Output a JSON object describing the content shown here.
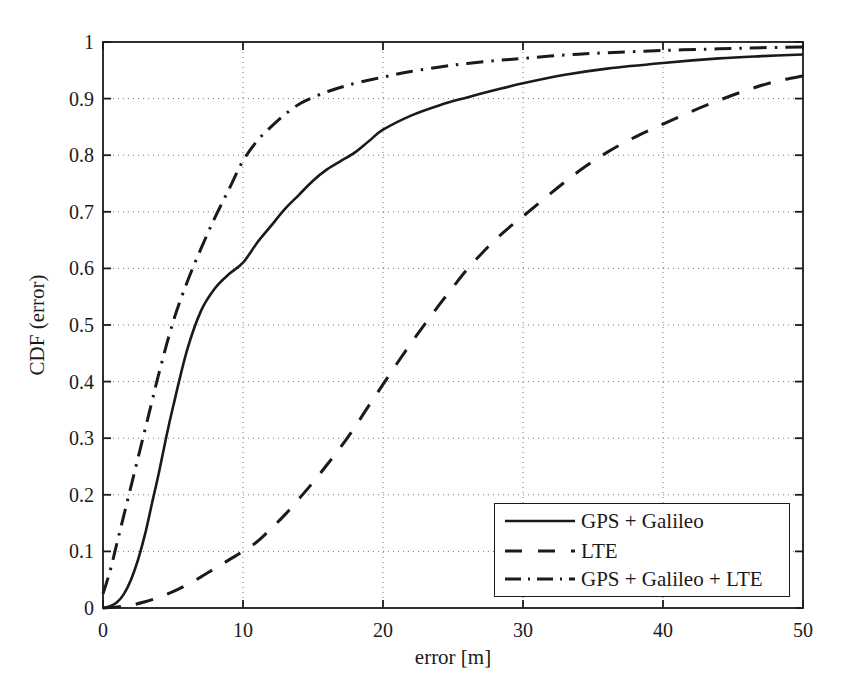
{
  "chart_data": {
    "type": "line",
    "title": "",
    "xlabel": "error [m]",
    "ylabel": "CDF (error)",
    "xlim": [
      0,
      50
    ],
    "ylim": [
      0,
      1
    ],
    "grid": true,
    "legend_position": "lower right",
    "xticks": [
      "0",
      "10",
      "20",
      "30",
      "40",
      "50"
    ],
    "xtick_values": [
      0,
      10,
      20,
      30,
      40,
      50
    ],
    "yticks": [
      "0",
      "0.1",
      "0.2",
      "0.3",
      "0.4",
      "0.5",
      "0.6",
      "0.7",
      "0.8",
      "0.9",
      "1"
    ],
    "ytick_values": [
      0,
      0.1,
      0.2,
      0.3,
      0.4,
      0.5,
      0.6,
      0.7,
      0.8,
      0.9,
      1
    ],
    "series": [
      {
        "name": "GPS + Galileo",
        "style": "solid",
        "color": "#1a1a1a",
        "x": [
          0,
          0.5,
          1,
          1.5,
          2,
          2.5,
          3,
          3.5,
          4,
          4.5,
          5,
          6,
          7,
          8,
          9,
          10,
          11,
          12,
          13,
          14,
          15,
          16,
          17,
          18,
          19,
          20,
          22,
          24,
          26,
          28,
          30,
          33,
          36,
          40,
          44,
          47,
          50
        ],
        "y": [
          0,
          0.003,
          0.01,
          0.025,
          0.05,
          0.085,
          0.13,
          0.185,
          0.24,
          0.3,
          0.355,
          0.455,
          0.525,
          0.565,
          0.59,
          0.61,
          0.645,
          0.675,
          0.705,
          0.73,
          0.755,
          0.775,
          0.79,
          0.805,
          0.825,
          0.845,
          0.87,
          0.888,
          0.902,
          0.915,
          0.927,
          0.942,
          0.953,
          0.963,
          0.971,
          0.975,
          0.978
        ]
      },
      {
        "name": "LTE",
        "style": "dashed",
        "color": "#1a1a1a",
        "x": [
          0,
          1,
          2,
          3,
          4,
          5,
          6,
          7,
          8,
          9,
          10,
          11,
          12,
          13,
          14,
          15,
          16,
          17,
          18,
          19,
          20,
          21,
          22,
          23,
          24,
          25,
          26,
          27,
          28,
          29,
          30,
          32,
          34,
          36,
          38,
          40,
          42,
          44,
          46,
          48,
          50
        ],
        "y": [
          0,
          0.002,
          0.005,
          0.011,
          0.019,
          0.029,
          0.041,
          0.055,
          0.07,
          0.085,
          0.1,
          0.117,
          0.14,
          0.165,
          0.193,
          0.222,
          0.253,
          0.285,
          0.32,
          0.358,
          0.395,
          0.432,
          0.468,
          0.502,
          0.535,
          0.567,
          0.598,
          0.625,
          0.65,
          0.672,
          0.692,
          0.733,
          0.772,
          0.805,
          0.832,
          0.855,
          0.877,
          0.897,
          0.915,
          0.93,
          0.94
        ]
      },
      {
        "name": "GPS + Galileo + LTE",
        "style": "dashdot",
        "color": "#1a1a1a",
        "x": [
          0,
          0.5,
          1,
          1.5,
          2,
          2.5,
          3,
          3.5,
          4,
          5,
          6,
          7,
          8,
          9,
          10,
          11,
          12,
          13,
          14,
          15,
          16,
          17,
          18,
          20,
          22,
          25,
          28,
          30,
          33,
          36,
          40,
          44,
          47,
          50
        ],
        "y": [
          0.025,
          0.065,
          0.115,
          0.165,
          0.215,
          0.265,
          0.315,
          0.365,
          0.415,
          0.505,
          0.575,
          0.635,
          0.69,
          0.74,
          0.79,
          0.825,
          0.85,
          0.872,
          0.89,
          0.902,
          0.912,
          0.92,
          0.927,
          0.938,
          0.948,
          0.959,
          0.967,
          0.971,
          0.977,
          0.981,
          0.985,
          0.988,
          0.99,
          0.991
        ]
      }
    ]
  },
  "legend": {
    "items": [
      {
        "label": "GPS + Galileo",
        "style": "solid"
      },
      {
        "label": "LTE",
        "style": "dashed"
      },
      {
        "label": "GPS + Galileo + LTE",
        "style": "dashdot"
      }
    ]
  }
}
